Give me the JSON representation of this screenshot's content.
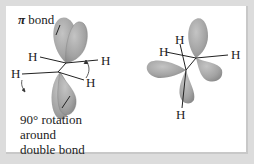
{
  "title": {
    "symbol": "π",
    "text": "bond"
  },
  "caption": {
    "lines": [
      "90° rotation",
      "around",
      "double bond"
    ]
  },
  "left_molecule": {
    "atoms": [
      "H",
      "H",
      "H",
      "H"
    ]
  },
  "right_molecule": {
    "atoms": [
      "H",
      "H",
      "H",
      "H"
    ]
  },
  "colors": {
    "lobe_fill": "#a6a6a6",
    "lobe_shadow": "#8a8a8a",
    "frame": "#dcdcdc",
    "panel": "#ffffff",
    "text": "#222222"
  }
}
